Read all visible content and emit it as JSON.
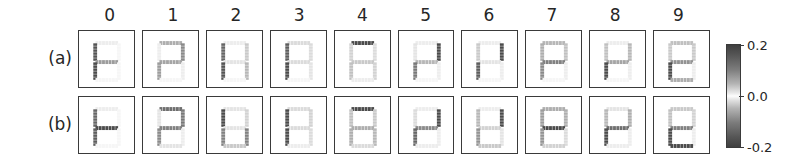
{
  "figure": {
    "row_labels": [
      "(a)",
      "(b)"
    ],
    "column_labels": [
      "0",
      "1",
      "2",
      "3",
      "4",
      "5",
      "6",
      "7",
      "8",
      "9"
    ]
  },
  "colorbar": {
    "ticks": [
      "0.2",
      "0.0",
      "-0.2"
    ],
    "vmin": -0.2,
    "vmax": 0.2,
    "colormap": "gray-diverging"
  },
  "chart_data": {
    "type": "heatmap",
    "title": "",
    "xlabel": "",
    "ylabel": "",
    "grid": false,
    "legend_position": "right",
    "colorbar": {
      "label": "",
      "ticks": [
        0.2,
        0.0,
        -0.2
      ],
      "range": [
        -0.2,
        0.2
      ]
    },
    "rows": [
      {
        "name": "(a)",
        "panels": [
          {
            "digit": "0",
            "segments": {
              "top": 0.02,
              "top_left": 0.19,
              "top_right": 0.01,
              "middle": 0.11,
              "bottom_left": 0.21,
              "bottom_right": 0.01,
              "bottom": 0.01
            }
          },
          {
            "digit": "1",
            "segments": {
              "top": 0.09,
              "top_left": 0.02,
              "top_right": 0.13,
              "middle": 0.1,
              "bottom_left": 0.11,
              "bottom_right": 0.02,
              "bottom": 0.01
            }
          },
          {
            "digit": "2",
            "segments": {
              "top": 0.02,
              "top_left": 0.17,
              "top_right": 0.06,
              "middle": 0.03,
              "bottom_left": 0.19,
              "bottom_right": 0.08,
              "bottom": 0.01
            }
          },
          {
            "digit": "3",
            "segments": {
              "top": 0.04,
              "top_left": 0.18,
              "top_right": 0.04,
              "middle": 0.04,
              "bottom_left": 0.2,
              "bottom_right": 0.03,
              "bottom": 0.01
            }
          },
          {
            "digit": "4",
            "segments": {
              "top": 0.2,
              "top_left": 0.05,
              "top_right": 0.04,
              "middle": 0.06,
              "bottom_left": 0.07,
              "bottom_right": 0.05,
              "bottom": 0.02
            }
          },
          {
            "digit": "5",
            "segments": {
              "top": 0.02,
              "top_left": 0.03,
              "top_right": 0.2,
              "middle": 0.08,
              "bottom_left": 0.15,
              "bottom_right": 0.02,
              "bottom": 0.01
            }
          },
          {
            "digit": "6",
            "segments": {
              "top": 0.02,
              "top_left": 0.06,
              "top_right": 0.21,
              "middle": 0.03,
              "bottom_left": 0.18,
              "bottom_right": 0.02,
              "bottom": 0.01
            }
          },
          {
            "digit": "7",
            "segments": {
              "top": 0.08,
              "top_left": 0.09,
              "top_right": 0.07,
              "middle": 0.14,
              "bottom_left": 0.13,
              "bottom_right": 0.02,
              "bottom": 0.01
            }
          },
          {
            "digit": "8",
            "segments": {
              "top": 0.02,
              "top_left": 0.07,
              "top_right": 0.08,
              "middle": 0.1,
              "bottom_left": 0.22,
              "bottom_right": 0.02,
              "bottom": 0.01
            }
          },
          {
            "digit": "9",
            "segments": {
              "top": 0.07,
              "top_left": 0.06,
              "top_right": 0.06,
              "middle": 0.12,
              "bottom_left": 0.21,
              "bottom_right": 0.02,
              "bottom": 0.09
            }
          }
        ]
      },
      {
        "name": "(b)",
        "panels": [
          {
            "digit": "0",
            "segments": {
              "top": 0.02,
              "top_left": 0.17,
              "top_right": 0.01,
              "middle": 0.2,
              "bottom_left": 0.18,
              "bottom_right": 0.01,
              "bottom": 0.01
            }
          },
          {
            "digit": "1",
            "segments": {
              "top": 0.16,
              "top_left": 0.03,
              "top_right": 0.15,
              "middle": 0.14,
              "bottom_left": 0.13,
              "bottom_right": 0.02,
              "bottom": 0.03
            }
          },
          {
            "digit": "2",
            "segments": {
              "top": 0.03,
              "top_left": 0.21,
              "top_right": 0.05,
              "middle": 0.03,
              "bottom_left": 0.14,
              "bottom_right": 0.14,
              "bottom": 0.06
            }
          },
          {
            "digit": "3",
            "segments": {
              "top": 0.04,
              "top_left": 0.22,
              "top_right": 0.05,
              "middle": 0.04,
              "bottom_left": 0.22,
              "bottom_right": 0.04,
              "bottom": 0.02
            }
          },
          {
            "digit": "4",
            "segments": {
              "top": 0.24,
              "top_left": 0.07,
              "top_right": 0.06,
              "middle": 0.09,
              "bottom_left": 0.09,
              "bottom_right": 0.08,
              "bottom": 0.04
            }
          },
          {
            "digit": "5",
            "segments": {
              "top": 0.02,
              "top_left": 0.04,
              "top_right": 0.22,
              "middle": 0.13,
              "bottom_left": 0.17,
              "bottom_right": 0.02,
              "bottom": 0.02
            }
          },
          {
            "digit": "6",
            "segments": {
              "top": 0.02,
              "top_left": 0.08,
              "top_right": 0.23,
              "middle": 0.05,
              "bottom_left": 0.12,
              "bottom_right": 0.03,
              "bottom": 0.06
            }
          },
          {
            "digit": "7",
            "segments": {
              "top": 0.09,
              "top_left": 0.11,
              "top_right": 0.09,
              "middle": 0.21,
              "bottom_left": 0.12,
              "bottom_right": 0.04,
              "bottom": 0.05
            }
          },
          {
            "digit": "8",
            "segments": {
              "top": 0.03,
              "top_left": 0.08,
              "top_right": 0.09,
              "middle": 0.16,
              "bottom_left": 0.23,
              "bottom_right": 0.02,
              "bottom": 0.02
            }
          },
          {
            "digit": "9",
            "segments": {
              "top": 0.06,
              "top_left": 0.07,
              "top_right": 0.05,
              "middle": 0.14,
              "bottom_left": 0.23,
              "bottom_right": 0.02,
              "bottom": 0.21
            }
          }
        ]
      }
    ]
  }
}
